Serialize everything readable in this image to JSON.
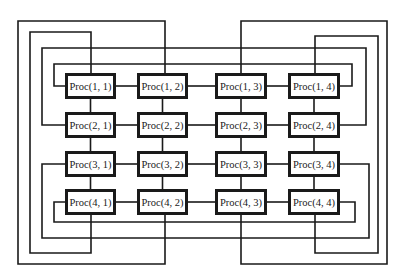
{
  "diagram": {
    "type": "2D torus (wraparound mesh) of 4x4 processors",
    "line_color": "#1a1a1a",
    "grid": {
      "rows": 4,
      "cols": 4
    },
    "col_x": [
      65,
      137,
      215,
      288
    ],
    "col_w": [
      51,
      51,
      52,
      52
    ],
    "row_y": [
      73,
      112,
      151,
      189
    ],
    "box_h": 26,
    "processors": [
      [
        {
          "label": "Proc(1, 1)"
        },
        {
          "label": "Proc(1, 2)"
        },
        {
          "label": "Proc(1, 3)"
        },
        {
          "label": "Proc(1, 4)"
        }
      ],
      [
        {
          "label": "Proc(2, 1)"
        },
        {
          "label": "Proc(2, 2)"
        },
        {
          "label": "Proc(2, 3)"
        },
        {
          "label": "Proc(2, 4)"
        }
      ],
      [
        {
          "label": "Proc(3, 1)"
        },
        {
          "label": "Proc(3, 2)"
        },
        {
          "label": "Proc(3, 3)"
        },
        {
          "label": "Proc(3, 4)"
        }
      ],
      [
        {
          "label": "Proc(4, 1)"
        },
        {
          "label": "Proc(4, 2)"
        },
        {
          "label": "Proc(4, 3)"
        },
        {
          "label": "Proc(4, 4)"
        }
      ]
    ],
    "wrap_links": {
      "rows": [
        {
          "row": 1,
          "points": [
            [
              65,
              86
            ],
            [
              54,
              86
            ],
            [
              54,
              64
            ],
            [
              352,
              64
            ],
            [
              352,
              86
            ],
            [
              340,
              86
            ]
          ]
        },
        {
          "row": 2,
          "points": [
            [
              65,
              125
            ],
            [
              42,
              125
            ],
            [
              42,
              48
            ],
            [
              366,
              48
            ],
            [
              366,
              125
            ],
            [
              340,
              125
            ]
          ]
        },
        {
          "row": 3,
          "points": [
            [
              65,
              164
            ],
            [
              42,
              164
            ],
            [
              42,
              238
            ],
            [
              369,
              238
            ],
            [
              369,
              164
            ],
            [
              340,
              164
            ]
          ]
        },
        {
          "row": 4,
          "points": [
            [
              65,
              202
            ],
            [
              54,
              202
            ],
            [
              54,
              222
            ],
            [
              355,
              222
            ],
            [
              355,
              202
            ],
            [
              340,
              202
            ]
          ]
        }
      ],
      "cols": [
        {
          "col": 1,
          "points": [
            [
              91,
              73
            ],
            [
              91,
              32
            ],
            [
              30,
              32
            ],
            [
              30,
              253
            ],
            [
              91,
              253
            ],
            [
              91,
              215
            ]
          ]
        },
        {
          "col": 2,
          "points": [
            [
              165,
              73
            ],
            [
              165,
              21
            ],
            [
              18,
              21
            ],
            [
              18,
              264
            ],
            [
              165,
              264
            ],
            [
              165,
              215
            ]
          ]
        },
        {
          "col": 3,
          "points": [
            [
              241,
              73
            ],
            [
              241,
              21
            ],
            [
              387,
              21
            ],
            [
              387,
              264
            ],
            [
              241,
              264
            ],
            [
              241,
              215
            ]
          ]
        },
        {
          "col": 4,
          "points": [
            [
              315,
              73
            ],
            [
              315,
              36
            ],
            [
              378,
              36
            ],
            [
              378,
              253
            ],
            [
              315,
              253
            ],
            [
              315,
              215
            ]
          ]
        }
      ]
    }
  }
}
